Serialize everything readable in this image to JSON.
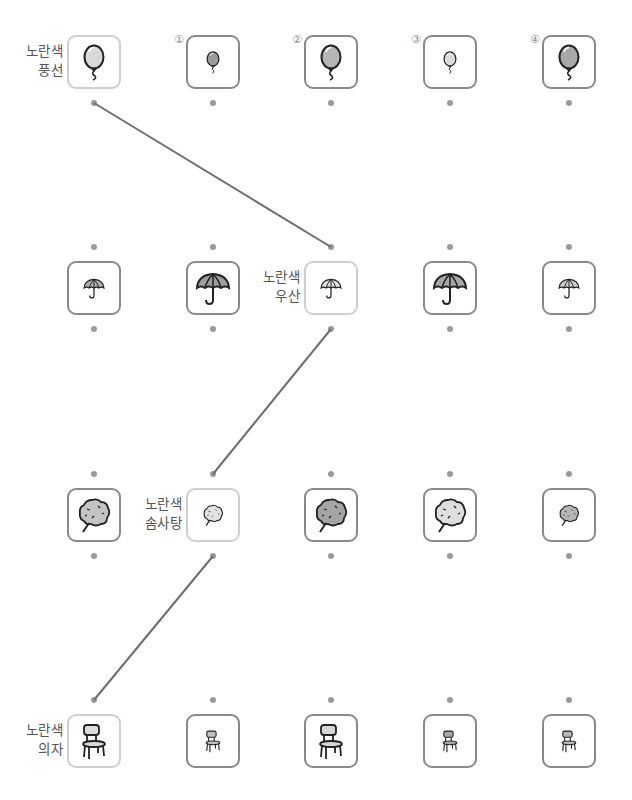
{
  "option_numbers": [
    "①",
    "②",
    "③",
    "④"
  ],
  "rows": [
    {
      "label_line1": "노란색",
      "label_line2": "풍선",
      "object": "balloon",
      "target_column": 0,
      "cells": [
        {
          "role": "target",
          "icon": "balloon-icon",
          "size": "large",
          "fill": "#d9d9d9"
        },
        {
          "role": "option",
          "number": "①",
          "icon": "balloon-icon",
          "size": "small",
          "fill": "#9a9a9a"
        },
        {
          "role": "option",
          "number": "②",
          "icon": "balloon-icon",
          "size": "large",
          "fill": "#b5b5b5"
        },
        {
          "role": "option",
          "number": "③",
          "icon": "balloon-icon",
          "size": "small",
          "fill": "#dcdcdc"
        },
        {
          "role": "option",
          "number": "④",
          "icon": "balloon-icon",
          "size": "large",
          "fill": "#a8a8a8"
        }
      ]
    },
    {
      "label_line1": "노란색",
      "label_line2": "우산",
      "object": "umbrella",
      "target_column": 2,
      "cells": [
        {
          "role": "option",
          "icon": "umbrella-icon",
          "size": "small",
          "fill": "#b0b0b0"
        },
        {
          "role": "option",
          "icon": "umbrella-icon",
          "size": "large",
          "fill": "#9e9e9e"
        },
        {
          "role": "target",
          "icon": "umbrella-icon",
          "size": "small",
          "fill": "#e0e0e0"
        },
        {
          "role": "option",
          "icon": "umbrella-icon",
          "size": "large",
          "fill": "#a8a8a8"
        },
        {
          "role": "option",
          "icon": "umbrella-icon",
          "size": "small",
          "fill": "#d0d0d0"
        }
      ]
    },
    {
      "label_line1": "노란색",
      "label_line2": "솜사탕",
      "object": "cotton-candy",
      "target_column": 1,
      "cells": [
        {
          "role": "option",
          "icon": "cotton-candy-icon",
          "size": "large",
          "fill": "#c4c4c4"
        },
        {
          "role": "target",
          "icon": "cotton-candy-icon",
          "size": "small",
          "fill": "#e2e2e2"
        },
        {
          "role": "option",
          "icon": "cotton-candy-icon",
          "size": "large",
          "fill": "#a5a5a5"
        },
        {
          "role": "option",
          "icon": "cotton-candy-icon",
          "size": "large",
          "fill": "#dedede"
        },
        {
          "role": "option",
          "icon": "cotton-candy-icon",
          "size": "small",
          "fill": "#b5b5b5"
        }
      ]
    },
    {
      "label_line1": "노란색",
      "label_line2": "의자",
      "object": "chair",
      "target_column": 0,
      "cells": [
        {
          "role": "target",
          "icon": "chair-icon",
          "size": "large",
          "fill": "#dcdcdc"
        },
        {
          "role": "option",
          "icon": "chair-icon",
          "size": "small",
          "fill": "#c0c0c0"
        },
        {
          "role": "option",
          "icon": "chair-icon",
          "size": "large",
          "fill": "#d6d6d6"
        },
        {
          "role": "option",
          "icon": "chair-icon",
          "size": "small",
          "fill": "#a8a8a8"
        },
        {
          "role": "option",
          "icon": "chair-icon",
          "size": "small",
          "fill": "#b8b8b8"
        }
      ]
    }
  ],
  "connections": [
    {
      "from_row": 0,
      "from_col": 0,
      "to_row": 1,
      "to_col": 2
    },
    {
      "from_row": 1,
      "from_col": 2,
      "to_row": 2,
      "to_col": 1
    },
    {
      "from_row": 2,
      "from_col": 1,
      "to_row": 3,
      "to_col": 0
    }
  ],
  "colors": {
    "line": "#6e6e6e",
    "dot": "#9a9a9a",
    "target_border": "#cfcfcf",
    "option_border": "#8a8a8a",
    "label_text": "#555555"
  }
}
